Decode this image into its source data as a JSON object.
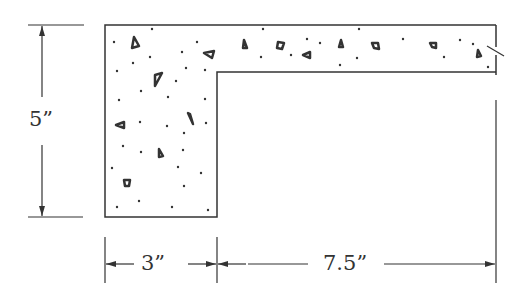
{
  "diagram": {
    "type": "L-shaped concrete section (concrete hatching)",
    "colors": {
      "line": "#333333",
      "background": "#ffffff"
    },
    "dimensions": {
      "height": {
        "label": "5”",
        "value": 5,
        "unit": "in"
      },
      "web_width": {
        "label": "3”",
        "value": 3,
        "unit": "in"
      },
      "flange_extension": {
        "label": "7.5”",
        "value": 7.5,
        "unit": "in"
      }
    },
    "features": [
      "concrete-hatch-pattern",
      "break-line-right-end",
      "dimension-arrows"
    ]
  }
}
